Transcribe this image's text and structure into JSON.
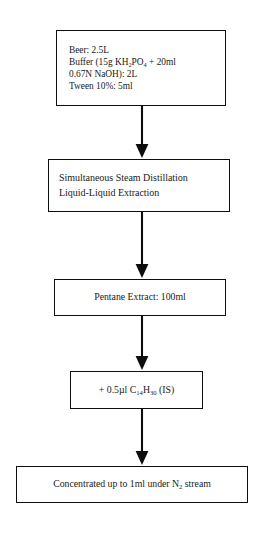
{
  "diagram": {
    "orientation": "vertical top-to-bottom",
    "background_color": "#ffffff",
    "border_color": "#0d0d0d",
    "text_color": "#1a1a1a",
    "nodes": [
      {
        "id": "sample",
        "name": "sample-preparation",
        "align": "left",
        "lines": [
          "Beer:  2.5L",
          "Buffer (15g KH₂PO₄ + 20ml",
          "0.67N NaOH):  2L",
          "Tween 10%:  5ml"
        ],
        "line1_pre": "Beer:  2.5L",
        "line2_a": "Buffer (15g KH",
        "line2_sub1": "2",
        "line2_b": "PO",
        "line2_sub2": "4",
        "line2_c": " + 20ml",
        "line3": "0.67N NaOH):  2L",
        "line4": "Tween 10%:  5ml"
      },
      {
        "id": "distillation",
        "name": "distillation-extraction",
        "align": "left",
        "line1": "Simultaneous Steam Distillation",
        "line2": "Liquid-Liquid Extraction"
      },
      {
        "id": "pentane",
        "name": "pentane-extract",
        "align": "center",
        "line1": "Pentane Extract:  100ml"
      },
      {
        "id": "standard",
        "name": "internal-standard-addition",
        "align": "center",
        "prefix": "+ 0.5µl C",
        "sub1": "14",
        "mid": "H",
        "sub2": "30",
        "suffix": " (IS)"
      },
      {
        "id": "concentrate",
        "name": "concentration-step",
        "align": "center",
        "prefix": "Concentrated up to 1ml under N",
        "sub1": "2",
        "suffix": " stream"
      }
    ],
    "arrows": [
      {
        "id": "arrow-1",
        "from": "sample",
        "to": "distillation",
        "direction": "down"
      },
      {
        "id": "arrow-2",
        "from": "distillation",
        "to": "pentane",
        "direction": "down"
      },
      {
        "id": "arrow-3",
        "from": "pentane",
        "to": "standard",
        "direction": "down"
      },
      {
        "id": "arrow-4",
        "from": "standard",
        "to": "concentrate",
        "direction": "down"
      }
    ]
  }
}
